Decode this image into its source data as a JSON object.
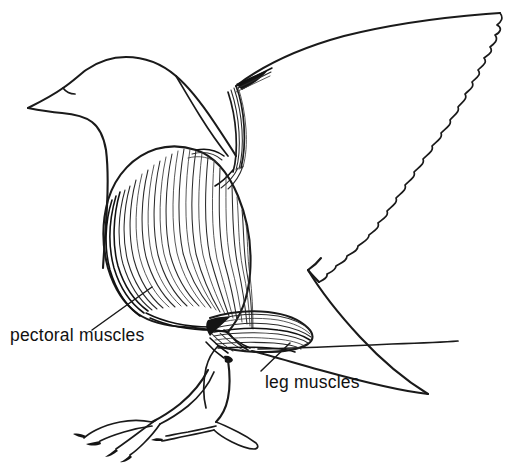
{
  "figure": {
    "style": "black and white line drawing",
    "background_color": "#ffffff",
    "ink_color": "#1a1a1a",
    "width": 514,
    "height": 468
  },
  "labels": [
    {
      "id": "pectoral",
      "text": "pectoral muscles",
      "text_x": 10,
      "text_y": 341,
      "leader_from_x": 92,
      "leader_from_y": 330,
      "leader_to_x": 152,
      "leader_to_y": 287
    },
    {
      "id": "leg",
      "text": "leg muscles",
      "text_x": 265,
      "text_y": 388,
      "leader_from_x": 261,
      "leader_from_y": 371,
      "leader_to_x": 290,
      "leader_to_y": 343
    }
  ],
  "anatomy_parts": [
    {
      "name": "head",
      "description": "rounded gull head, upper left"
    },
    {
      "name": "beak",
      "description": "pointed beak aimed left"
    },
    {
      "name": "neck",
      "description": "curved neck descending to breast"
    },
    {
      "name": "pectoral-muscle-mass",
      "description": "large striated breast muscle, center left"
    },
    {
      "name": "humerus-wing-bone",
      "description": "upper wing bone with tendon striations"
    },
    {
      "name": "wing",
      "description": "large swept wing with scalloped feather trailing edge"
    },
    {
      "name": "leg-muscle-mass",
      "description": "striated thigh muscles below body"
    },
    {
      "name": "tarsus",
      "description": "thin lower leg"
    },
    {
      "name": "webbed-foot",
      "description": "webbed foot with clawed toes"
    },
    {
      "name": "tail",
      "description": "tail extending right beneath wing"
    }
  ]
}
